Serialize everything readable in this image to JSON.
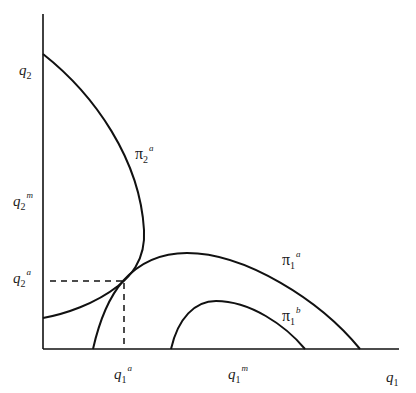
{
  "diagram": {
    "type": "reaction-curves",
    "axes": {
      "x_label": {
        "base": "q",
        "sub": "1",
        "sup": ""
      },
      "y_label": {
        "base": "q",
        "sub": "2",
        "sup": ""
      }
    },
    "tick_labels": {
      "q2m": {
        "base": "q",
        "sub": "2",
        "sup": "m"
      },
      "q2a": {
        "base": "q",
        "sub": "2",
        "sup": "a"
      },
      "q1a": {
        "base": "q",
        "sub": "1",
        "sup": "a"
      },
      "q1m": {
        "base": "q",
        "sub": "1",
        "sup": "m"
      }
    },
    "curves": [
      {
        "id": "pi2a",
        "label": {
          "base": "π",
          "sub": "2",
          "sup": "a"
        }
      },
      {
        "id": "pi1a",
        "label": {
          "base": "π",
          "sub": "1",
          "sup": "a"
        }
      },
      {
        "id": "pi1b",
        "label": {
          "base": "π",
          "sub": "1",
          "sup": "b"
        }
      }
    ],
    "equilibrium": {
      "label_x": "q1a",
      "label_y": "q2a",
      "style": "dashed"
    },
    "colors": {
      "line": "#111111",
      "text": "#1a1a1a",
      "background": "#ffffff"
    }
  }
}
